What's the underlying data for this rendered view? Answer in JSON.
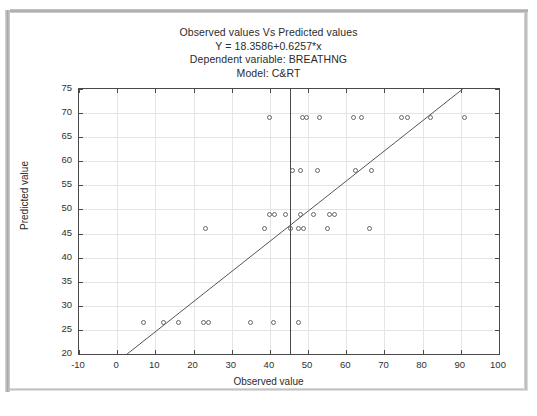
{
  "figure": {
    "title_lines": [
      "Observed values Vs Predicted values",
      "Y = 18.3586+0.6257*x",
      "Dependent variable: BREATHNG",
      "Model: C&RT"
    ]
  },
  "chart_data": {
    "type": "scatter",
    "title": "Observed values Vs Predicted values",
    "subtitle": "Y = 18.3586+0.6257*x",
    "dependent_variable": "BREATHNG",
    "model": "C&RT",
    "xlabel": "Observed value",
    "ylabel": "Predicted value",
    "xlim": [
      -10,
      100
    ],
    "ylim": [
      20,
      75
    ],
    "xticks": [
      -10,
      0,
      10,
      20,
      30,
      40,
      50,
      60,
      70,
      80,
      90,
      100
    ],
    "yticks": [
      20,
      25,
      30,
      35,
      40,
      45,
      50,
      55,
      60,
      65,
      70,
      75
    ],
    "grid": true,
    "legend": "none",
    "marker": "open-circle",
    "fit_line": {
      "intercept": 18.3586,
      "slope": 0.6257,
      "x_start": 2.5,
      "x_end": 90.5
    },
    "reference_line": {
      "orientation": "vertical",
      "x": 45.3
    },
    "points": [
      [
        7.0,
        26.5
      ],
      [
        12.0,
        26.5
      ],
      [
        16.0,
        26.5
      ],
      [
        22.5,
        26.5
      ],
      [
        24.0,
        26.5
      ],
      [
        35.0,
        26.5
      ],
      [
        41.0,
        26.5
      ],
      [
        47.5,
        26.5
      ],
      [
        23.0,
        46.0
      ],
      [
        38.5,
        46.0
      ],
      [
        45.3,
        46.0
      ],
      [
        47.5,
        46.0
      ],
      [
        48.8,
        46.0
      ],
      [
        55.0,
        46.0
      ],
      [
        66.0,
        46.0
      ],
      [
        40.0,
        49.0
      ],
      [
        41.3,
        49.0
      ],
      [
        44.0,
        49.0
      ],
      [
        48.0,
        49.0
      ],
      [
        51.5,
        49.0
      ],
      [
        55.5,
        49.0
      ],
      [
        57.0,
        49.0
      ],
      [
        46.0,
        58.0
      ],
      [
        48.0,
        58.0
      ],
      [
        52.5,
        58.0
      ],
      [
        62.5,
        58.0
      ],
      [
        66.5,
        58.0
      ],
      [
        40.0,
        69.0
      ],
      [
        48.5,
        69.0
      ],
      [
        49.5,
        69.0
      ],
      [
        53.0,
        69.0
      ],
      [
        62.0,
        69.0
      ],
      [
        64.0,
        69.0
      ],
      [
        74.5,
        69.0
      ],
      [
        76.0,
        69.0
      ],
      [
        82.0,
        69.0
      ],
      [
        91.0,
        69.0
      ]
    ]
  },
  "colors": {
    "marker_stroke": "#666666",
    "axis": "#4a4a4a",
    "grid": "#e4e4e4",
    "text": "#2b2b2b"
  }
}
